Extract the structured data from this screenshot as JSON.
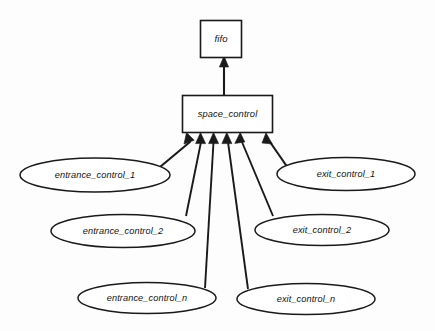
{
  "diagram": {
    "background_color": "#fdfdfd",
    "line_color": "#1a1a1a",
    "fill_color": "#ffffff",
    "nodes": {
      "fifo": {
        "label": "fifo",
        "shape": "rectangle"
      },
      "space_control": {
        "label": "space_control",
        "shape": "rectangle"
      },
      "entrance_control_1": {
        "label": "entrance_control_1",
        "shape": "ellipse"
      },
      "entrance_control_2": {
        "label": "entrance_control_2",
        "shape": "ellipse"
      },
      "entrance_control_n": {
        "label": "entrance_control_n",
        "shape": "ellipse"
      },
      "exit_control_1": {
        "label": "exit_control_1",
        "shape": "ellipse"
      },
      "exit_control_2": {
        "label": "exit_control_2",
        "shape": "ellipse"
      },
      "exit_control_n": {
        "label": "exit_control_n",
        "shape": "ellipse"
      }
    },
    "edges": [
      {
        "from": "space_control",
        "to": "fifo",
        "arrow": "to"
      },
      {
        "from": "entrance_control_1",
        "to": "space_control",
        "arrow": "to"
      },
      {
        "from": "entrance_control_2",
        "to": "space_control",
        "arrow": "to"
      },
      {
        "from": "entrance_control_n",
        "to": "space_control",
        "arrow": "to"
      },
      {
        "from": "exit_control_1",
        "to": "space_control",
        "arrow": "to"
      },
      {
        "from": "exit_control_2",
        "to": "space_control",
        "arrow": "to"
      },
      {
        "from": "exit_control_n",
        "to": "space_control",
        "arrow": "to"
      }
    ]
  }
}
